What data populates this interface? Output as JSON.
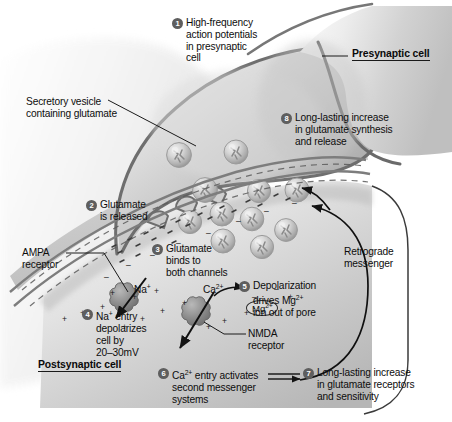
{
  "figure": {
    "type": "diagram"
  },
  "headers": {
    "presynaptic": "Presynaptic cell",
    "postsynaptic": "Postsynaptic cell"
  },
  "callouts": {
    "vesicle": "Secretory vesicle\ncontaining glutamate",
    "ampa": "AMPA\nreceptor",
    "nmda": "NMDA\nreceptor",
    "retrograde": "Retrograde\nmessenger"
  },
  "ions": {
    "na": "Na",
    "na_charge": "+",
    "ca": "Ca",
    "ca_charge": "2+",
    "mg": "Mg",
    "mg_charge": "2+"
  },
  "steps": [
    {
      "num": "1",
      "text": "High-frequency\naction potentials\nin presynaptic\ncell"
    },
    {
      "num": "2",
      "text": "Glutamate\nis released"
    },
    {
      "num": "3",
      "text": "Glutamate\nbinds to\nboth channels"
    },
    {
      "num": "4",
      "text": "Na+ entry\ndepolarizes\ncell by\n20–30mV"
    },
    {
      "num": "5",
      "text": "Depolarization\ndrives Mg2+\nion out of pore"
    },
    {
      "num": "6",
      "text": "Ca2+ entry activates\nsecond messenger\nsystems"
    },
    {
      "num": "7",
      "text": "Long-lasting increase\nin glutamate receptors\nand sensitivity"
    },
    {
      "num": "8",
      "text": "Long-lasting increase\nin glutamate synthesis\nand release"
    }
  ],
  "colors": {
    "ink": "#0d0d0d",
    "bullet_fill": "#5e5e5e",
    "membrane": "#6d6d6d",
    "cell_light": "#e8e8e8",
    "cell_mid": "#c8c8c8",
    "cell_dark": "#9a9a9a",
    "background": "#ffffff"
  }
}
